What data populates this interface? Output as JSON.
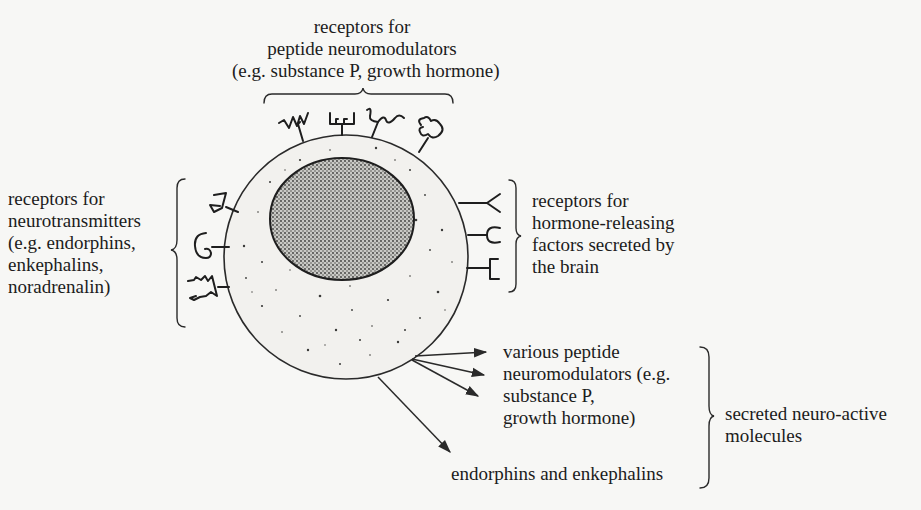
{
  "diagram": {
    "colors": {
      "background": "#f7f7f5",
      "ink": "#1c1c1c",
      "cytoplasm": "#f2f1ee",
      "nucleus": "#9a9a96"
    },
    "cell": {
      "label": "cell body",
      "center": [
        346,
        257
      ],
      "radius": 122
    },
    "nucleus": {
      "label": "nucleus",
      "center": [
        342,
        219
      ],
      "rx": 72,
      "ry": 61
    },
    "groups": {
      "top": {
        "lines": [
          "receptors for",
          "peptide neuromodulators",
          "(e.g. substance P, growth hormone)"
        ],
        "receptor_icons": [
          "zigzag-receptor-icon",
          "comb-receptor-icon",
          "wave-receptor-icon",
          "lobed-receptor-icon"
        ]
      },
      "left": {
        "lines": [
          "receptors for",
          "neurotransmitters",
          "(e.g. endorphins,",
          "enkephalins,",
          "noradrenalin)"
        ],
        "receptor_icons": [
          "triangle-receptor-icon",
          "curl-receptor-icon",
          "jagged-receptor-icon"
        ]
      },
      "right": {
        "lines": [
          "receptors for",
          "hormone-releasing",
          "factors secreted by",
          "the brain"
        ],
        "receptor_icons": [
          "v-shaped-receptor-icon",
          "c-shaped-receptor-icon",
          "bracket-receptor-icon"
        ]
      },
      "secreted_peptides": {
        "lines": [
          "various peptide",
          "neuromodulators (e.g.",
          "substance P,",
          "growth hormone)"
        ]
      },
      "secreted_endorphins": {
        "lines": [
          "endorphins and enkephalins"
        ]
      },
      "secreted_group": {
        "lines": [
          "secreted neuro-active",
          "molecules"
        ]
      }
    }
  }
}
